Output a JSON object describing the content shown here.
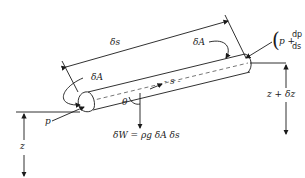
{
  "diagram": {
    "type": "streamtube-element",
    "labels": {
      "delta_s": "δs",
      "delta_A_upper": "δA",
      "delta_A_lower": "δA",
      "s_axis": "- s -",
      "theta": "θ",
      "p_inlet": "p",
      "p_outlet_open": "(",
      "p_outlet_p": "p +",
      "p_outlet_num": "dp",
      "p_outlet_den": "ds",
      "p_outlet_ds": "δs",
      "p_outlet_close": ")",
      "z": "z",
      "z_plus_dz": "z + δz",
      "weight": "δW = ρg δA δs"
    },
    "colors": {
      "line": "#1a1a1a",
      "background": "#ffffff"
    }
  }
}
